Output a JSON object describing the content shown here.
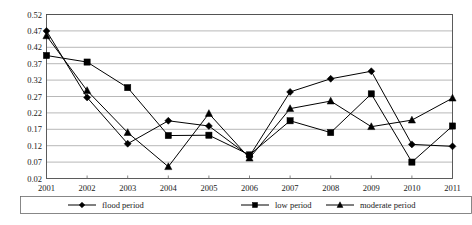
{
  "chart_data": {
    "type": "line",
    "title": "",
    "xlabel": "",
    "ylabel": "",
    "categories": [
      "2001",
      "2002",
      "2003",
      "2004",
      "2005",
      "2006",
      "2007",
      "2008",
      "2009",
      "2010",
      "2011"
    ],
    "x": [
      2001,
      2002,
      2003,
      2004,
      2005,
      2006,
      2007,
      2008,
      2009,
      2010,
      2011
    ],
    "ylim": [
      0.02,
      0.52
    ],
    "yticks": [
      0.02,
      0.07,
      0.12,
      0.17,
      0.22,
      0.27,
      0.32,
      0.37,
      0.42,
      0.47,
      0.52
    ],
    "ytick_labels": [
      "0.02",
      "0.07",
      "0.12",
      "0.17",
      "0.22",
      "0.27",
      "0.32",
      "0.37",
      "0.42",
      "0.47",
      "0.52"
    ],
    "xtick_labels": [
      "2001",
      "2002",
      "2003",
      "2004",
      "2005",
      "2006",
      "2007",
      "2008",
      "2009",
      "2010",
      "2011"
    ],
    "grid": "horizontal",
    "legend_position": "bottom",
    "series": [
      {
        "name": "flood period",
        "marker": "diamond",
        "color": "#000000",
        "values": [
          0.47,
          0.267,
          0.126,
          0.196,
          0.18,
          0.088,
          0.284,
          0.324,
          0.347,
          0.124,
          0.118
        ]
      },
      {
        "name": "low period",
        "marker": "square",
        "color": "#000000",
        "values": [
          0.395,
          0.375,
          0.297,
          0.151,
          0.152,
          0.092,
          0.196,
          0.16,
          0.278,
          0.07,
          0.18
        ]
      },
      {
        "name": "moderate period",
        "marker": "triangle",
        "color": "#000000",
        "values": [
          0.455,
          0.288,
          0.16,
          0.056,
          0.218,
          0.082,
          0.233,
          0.256,
          0.178,
          0.198,
          0.265
        ]
      }
    ]
  },
  "legend": {
    "items": [
      {
        "label": "flood period",
        "marker": "diamond"
      },
      {
        "label": "low period",
        "marker": "square"
      },
      {
        "label": "moderate period",
        "marker": "triangle"
      }
    ]
  },
  "axes": {
    "y_min_label": "0.02",
    "y_max_label": "0.52"
  }
}
